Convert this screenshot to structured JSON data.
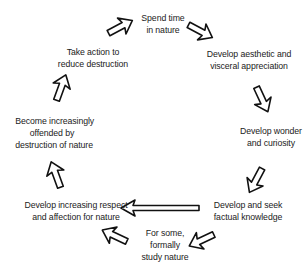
{
  "diagram": {
    "type": "cycle",
    "nodes": [
      {
        "id": "n1",
        "lines": [
          "Spend time",
          "in nature"
        ]
      },
      {
        "id": "n2",
        "lines": [
          "Develop aesthetic and",
          "visceral appreciation"
        ]
      },
      {
        "id": "n3",
        "lines": [
          "Develop wonder",
          "and curiosity"
        ]
      },
      {
        "id": "n4",
        "lines": [
          "Develop and seek",
          "factual knowledge"
        ]
      },
      {
        "id": "n5",
        "lines": [
          "For some,",
          "formally",
          "study nature"
        ]
      },
      {
        "id": "n6",
        "lines": [
          "Develop increasing respect",
          "and affection for nature"
        ]
      },
      {
        "id": "n7",
        "lines": [
          "Become increasingly",
          "offended by",
          "destruction of nature"
        ]
      },
      {
        "id": "n8",
        "lines": [
          "Take action to",
          "reduce destruction"
        ]
      }
    ],
    "edges": [
      {
        "from": "n1",
        "to": "n2"
      },
      {
        "from": "n2",
        "to": "n3"
      },
      {
        "from": "n3",
        "to": "n4"
      },
      {
        "from": "n4",
        "to": "n5"
      },
      {
        "from": "n5",
        "to": "n6"
      },
      {
        "from": "n4",
        "to": "n6"
      },
      {
        "from": "n6",
        "to": "n7"
      },
      {
        "from": "n7",
        "to": "n8"
      },
      {
        "from": "n8",
        "to": "n1"
      }
    ],
    "colors": {
      "text": "#222222",
      "arrow_stroke": "#111111",
      "arrow_fill": "#ffffff",
      "background": "#ffffff"
    }
  }
}
